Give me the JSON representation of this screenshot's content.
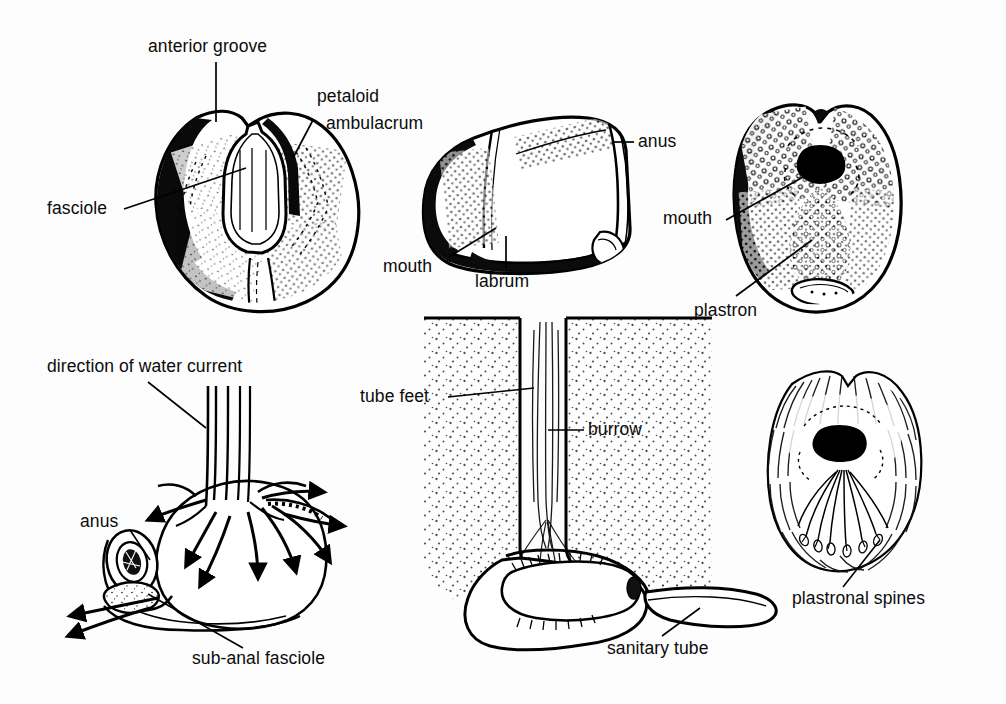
{
  "figure": {
    "background_color": "#fdfdfd",
    "ink_color": "#000000",
    "panels": [
      {
        "id": "aboral-view",
        "name": "aboral (upper) surface of test",
        "labels": [
          {
            "key": "anterior_groove",
            "text": "anterior groove",
            "x": 148,
            "y": 38,
            "leader": "vertical"
          },
          {
            "key": "petaloid",
            "text": "petaloid",
            "x": 317,
            "y": 88,
            "leader": "diagonal"
          },
          {
            "key": "ambulacrum",
            "text": "ambulacrum",
            "x": 326,
            "y": 115,
            "leader": "none"
          },
          {
            "key": "fasciole",
            "text": "fasciole",
            "x": 47,
            "y": 200,
            "leader": "diagonal"
          }
        ]
      },
      {
        "id": "lateral-view",
        "name": "lateral (side) view of test",
        "labels": [
          {
            "key": "anus",
            "text": "anus",
            "x": 638,
            "y": 133,
            "leader": "horizontal"
          },
          {
            "key": "mouth",
            "text": "mouth",
            "x": 383,
            "y": 258,
            "leader": "diagonal"
          },
          {
            "key": "labrum",
            "text": "labrum",
            "x": 475,
            "y": 272,
            "leader": "vertical"
          }
        ]
      },
      {
        "id": "oral-view",
        "name": "oral (lower) surface of test",
        "labels": [
          {
            "key": "mouth",
            "text": "mouth",
            "x": 663,
            "y": 210,
            "leader": "diagonal"
          },
          {
            "key": "plastron",
            "text": "plastron",
            "x": 694,
            "y": 302,
            "leader": "diagonal"
          }
        ]
      },
      {
        "id": "water-current-view",
        "name": "water current circulation around buried urchin",
        "labels": [
          {
            "key": "direction_of_water_current",
            "text": "direction of water current",
            "x": 47,
            "y": 358,
            "leader": "diagonal"
          },
          {
            "key": "anus",
            "text": "anus",
            "x": 80,
            "y": 513,
            "leader": "diagonal"
          },
          {
            "key": "sub_anal_fasciole",
            "text": "sub-anal fasciole",
            "x": 192,
            "y": 650,
            "leader": "diagonal"
          }
        ]
      },
      {
        "id": "burrow-section",
        "name": "vertical section through burrow in sediment",
        "labels": [
          {
            "key": "tube_feet",
            "text": "tube feet",
            "x": 360,
            "y": 388,
            "leader": "horizontal"
          },
          {
            "key": "burrow",
            "text": "burrow",
            "x": 588,
            "y": 420,
            "leader": "horizontal"
          },
          {
            "key": "sanitary_tube",
            "text": "sanitary tube",
            "x": 607,
            "y": 640,
            "leader": "diagonal"
          }
        ]
      },
      {
        "id": "spinous-specimen",
        "name": "oral view of living urchin with spines",
        "labels": [
          {
            "key": "plastronal_spines",
            "text": "plastronal spines",
            "x": 792,
            "y": 590,
            "leader": "diagonal"
          }
        ]
      }
    ]
  },
  "labels": {
    "anterior_groove": "anterior groove",
    "petaloid": "petaloid",
    "ambulacrum": "ambulacrum",
    "fasciole": "fasciole",
    "anus_lateral": "anus",
    "mouth_lateral": "mouth",
    "labrum": "labrum",
    "mouth_oral": "mouth",
    "plastron": "plastron",
    "direction_of_water_current": "direction of water current",
    "anus_current": "anus",
    "sub_anal_fasciole": "sub-anal fasciole",
    "tube_feet": "tube feet",
    "burrow": "burrow",
    "sanitary_tube": "sanitary tube",
    "plastronal_spines": "plastronal spines"
  }
}
